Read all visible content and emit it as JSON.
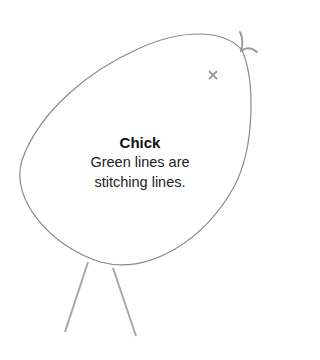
{
  "diagram": {
    "title": "Chick",
    "description_lines": [
      "Green lines are",
      "stitching lines."
    ],
    "marker_glyph": "×",
    "colors": {
      "outline": "#8a8a8a",
      "legs": "#a8a8a8",
      "tuft": "#9a9a9a",
      "marker": "#9a9a9a",
      "text": "#111111",
      "background": "#ffffff"
    }
  }
}
